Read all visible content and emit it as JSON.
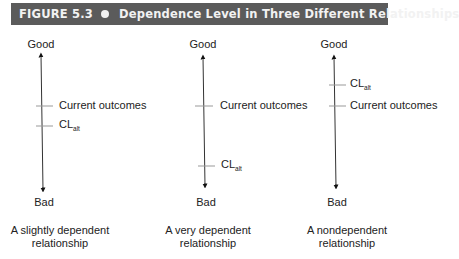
{
  "figure": {
    "number_label": "FIGURE 5.3",
    "separator_icon": "bullet-dot",
    "title": "Dependence Level in Three Different Relationships",
    "header_color": "#5b5b5b"
  },
  "axis_labels": {
    "top": "Good",
    "bottom": "Bad"
  },
  "panels": [
    {
      "caption_line1": "A slightly dependent",
      "caption_line2": "relationship",
      "markers": [
        {
          "label": "Current outcomes",
          "y": 106
        },
        {
          "label_main": "CL",
          "label_sub": "alt",
          "y": 126
        }
      ]
    },
    {
      "caption_line1": "A very dependent",
      "caption_line2": "relationship",
      "markers": [
        {
          "label": "Current outcomes",
          "y": 106
        },
        {
          "label_main": "CL",
          "label_sub": "alt",
          "y": 166
        }
      ]
    },
    {
      "caption_line1": "A nondependent",
      "caption_line2": "relationship",
      "markers": [
        {
          "label_main": "CL",
          "label_sub": "alt",
          "y": 85
        },
        {
          "label": "Current outcomes",
          "y": 106
        }
      ]
    }
  ]
}
